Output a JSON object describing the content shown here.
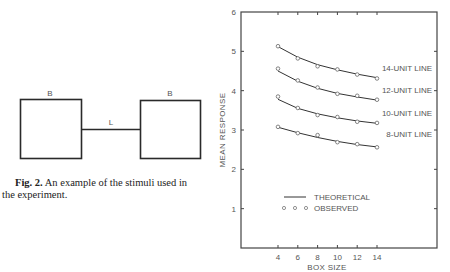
{
  "stimulus_figure": {
    "box_label_left": "B",
    "box_label_right": "B",
    "line_label": "L",
    "caption_bold": "Fig. 2.",
    "caption_line1": " An example of the stimuli used in",
    "caption_line2": "the experiment."
  },
  "chart_data": {
    "type": "line",
    "title": "",
    "xlabel": "BOX SIZE",
    "ylabel": "MEAN RESPONSE",
    "x": [
      4,
      6,
      8,
      10,
      12,
      14
    ],
    "xticks": [
      "4",
      "6",
      "8",
      "10",
      "12",
      "14"
    ],
    "yticks": [
      "1",
      "2",
      "3",
      "4",
      "5",
      "6"
    ],
    "xlim": [
      4,
      14
    ],
    "ylim": [
      0,
      6
    ],
    "grid": false,
    "series": [
      {
        "name": "14-UNIT LINE",
        "observed": [
          5.13,
          4.82,
          4.62,
          4.54,
          4.41,
          4.31
        ],
        "theoretical": [
          5.12,
          4.85,
          4.66,
          4.53,
          4.42,
          4.33
        ]
      },
      {
        "name": "12-UNIT LINE",
        "observed": [
          4.56,
          4.26,
          4.08,
          3.92,
          3.87,
          3.77
        ],
        "theoretical": [
          4.5,
          4.24,
          4.06,
          3.93,
          3.84,
          3.76
        ]
      },
      {
        "name": "10-UNIT LINE",
        "observed": [
          3.85,
          3.56,
          3.38,
          3.33,
          3.21,
          3.18
        ],
        "theoretical": [
          3.78,
          3.55,
          3.41,
          3.31,
          3.23,
          3.17
        ]
      },
      {
        "name": "8-UNIT LINE",
        "observed": [
          3.08,
          2.92,
          2.87,
          2.69,
          2.64,
          2.56
        ],
        "theoretical": [
          3.07,
          2.93,
          2.81,
          2.71,
          2.63,
          2.57
        ]
      }
    ],
    "legend": {
      "theoretical_label": "THEORETICAL",
      "observed_label": "OBSERVED",
      "position": "lower-left"
    }
  }
}
